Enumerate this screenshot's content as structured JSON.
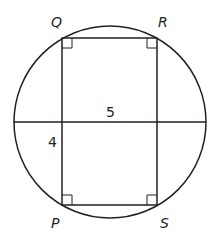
{
  "figure": {
    "vertices": {
      "Q": "Q",
      "R": "R",
      "P": "P",
      "S": "S"
    },
    "measurements": {
      "chord_segment": "5",
      "vertical_segment": "4"
    },
    "right_angle_markers": 4,
    "stroke_color": "#231f20"
  }
}
